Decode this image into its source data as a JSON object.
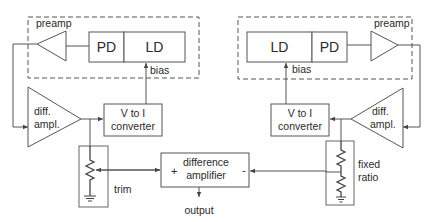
{
  "diagram": {
    "left": {
      "preamp_label": "preamp",
      "pd_label": "PD",
      "ld_label": "LD",
      "bias_label": "bias",
      "diff_amp_line1": "diff.",
      "diff_amp_line2": "ampl.",
      "v_to_i_line1": "V to I",
      "v_to_i_line2": "converter",
      "trim_label": "trim"
    },
    "right": {
      "preamp_label": "preamp",
      "pd_label": "PD",
      "ld_label": "LD",
      "bias_label": "bias",
      "diff_amp_line1": "diff.",
      "diff_amp_line2": "ampl.",
      "v_to_i_line1": "V to I",
      "v_to_i_line2": "converter",
      "fixed_ratio_line1": "fixed",
      "fixed_ratio_line2": "ratio"
    },
    "difference_amplifier": {
      "line1": "difference",
      "line2": "amplifier",
      "plus": "+",
      "minus": "-",
      "output_label": "output"
    },
    "colors": {
      "stroke": "#555555",
      "text": "#2a2a2a",
      "background": "#ffffff"
    }
  }
}
